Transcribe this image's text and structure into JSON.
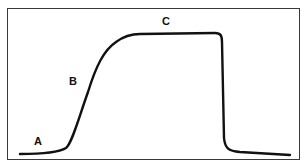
{
  "diagram": {
    "type": "curve",
    "labels": [
      {
        "id": "A",
        "text": "A"
      },
      {
        "id": "B",
        "text": "B"
      },
      {
        "id": "C",
        "text": "C"
      }
    ],
    "line_color": "#111111",
    "border_color": "#3a3a3a"
  }
}
